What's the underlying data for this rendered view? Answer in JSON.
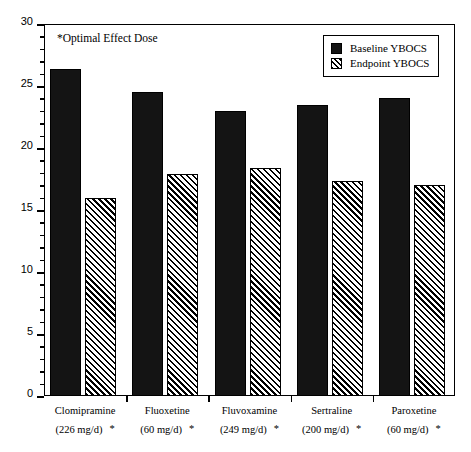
{
  "chart_data": {
    "type": "bar",
    "title": "",
    "subtitle": "",
    "xlabel": "",
    "ylabel": "",
    "ylim": [
      0,
      30
    ],
    "ytick_step": 5,
    "yticks": [
      0,
      5,
      10,
      15,
      20,
      25,
      30
    ],
    "ytick_labels": [
      "0",
      "5",
      "10",
      "15",
      "20",
      "25",
      "30"
    ],
    "minor_ticks": true,
    "grid": false,
    "legend_position": "top-right",
    "annotation": "*Optimal Effect Dose",
    "categories": [
      "Clomipramine",
      "Fluoxetine",
      "Fluvoxamine",
      "Sertraline",
      "Paroxetine"
    ],
    "category_doses": [
      "(226 mg/d)",
      "(60 mg/d)",
      "(249 mg/d)",
      "(200 mg/d)",
      "(60 mg/d)"
    ],
    "category_star": [
      "*",
      "*",
      "*",
      "*",
      "*"
    ],
    "series": [
      {
        "name": "Baseline YBOCS",
        "fill": "solid",
        "color": "#141414",
        "values": [
          26.4,
          24.5,
          23.0,
          23.5,
          24.0
        ]
      },
      {
        "name": "Endpoint YBOCS",
        "fill": "hatch",
        "color": "#ffffff",
        "values": [
          16.0,
          17.9,
          18.4,
          17.3,
          17.0
        ]
      }
    ]
  },
  "legend": {
    "items": [
      {
        "label": "Baseline YBOCS"
      },
      {
        "label": "Endpoint YBOCS"
      }
    ]
  },
  "colors": {
    "axis": "#000000",
    "bar_baseline": "#141414",
    "bar_endpoint_hatch": "#000000",
    "background": "#ffffff"
  }
}
